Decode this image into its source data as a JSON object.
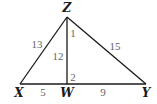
{
  "figure": {
    "type": "triangle-with-altitude",
    "vertices": {
      "Z": {
        "label": "Z",
        "x": 67,
        "y": 17
      },
      "X": {
        "label": "X",
        "x": 20,
        "y": 84
      },
      "W": {
        "label": "W",
        "x": 67,
        "y": 84
      },
      "Y": {
        "label": "Y",
        "x": 146,
        "y": 84
      }
    },
    "segments": {
      "XZ": {
        "label": "13"
      },
      "ZY": {
        "label": "15"
      },
      "ZW": {
        "label": "12"
      },
      "XW": {
        "label": "5"
      },
      "WY": {
        "label": "9"
      }
    },
    "angles": {
      "angle1": {
        "label": "1"
      },
      "angle2": {
        "label": "2"
      }
    },
    "colors": {
      "line": "#1a1a1a",
      "vertex_label": "#1a1a1a",
      "number_label": "#666666"
    }
  }
}
